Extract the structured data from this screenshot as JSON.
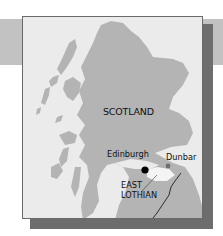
{
  "map": {
    "title_region": "SCOTLAND",
    "places": [
      {
        "name": "Edinburgh",
        "marker": "black-dot",
        "marker_color": "#000000"
      },
      {
        "name": "Dunbar",
        "marker": "gray-dot",
        "marker_color": "#6e6e6e"
      }
    ],
    "region_label": {
      "line1": "EAST",
      "line2": "LOTHIAN"
    },
    "colors": {
      "land": "#b4b4b4",
      "sea": "#ebebeb",
      "band": "#c2c2c2",
      "shadow": "#6d6d6d",
      "highlight_region": "#f4f4f4",
      "border_line": "#1e1e1e"
    }
  }
}
